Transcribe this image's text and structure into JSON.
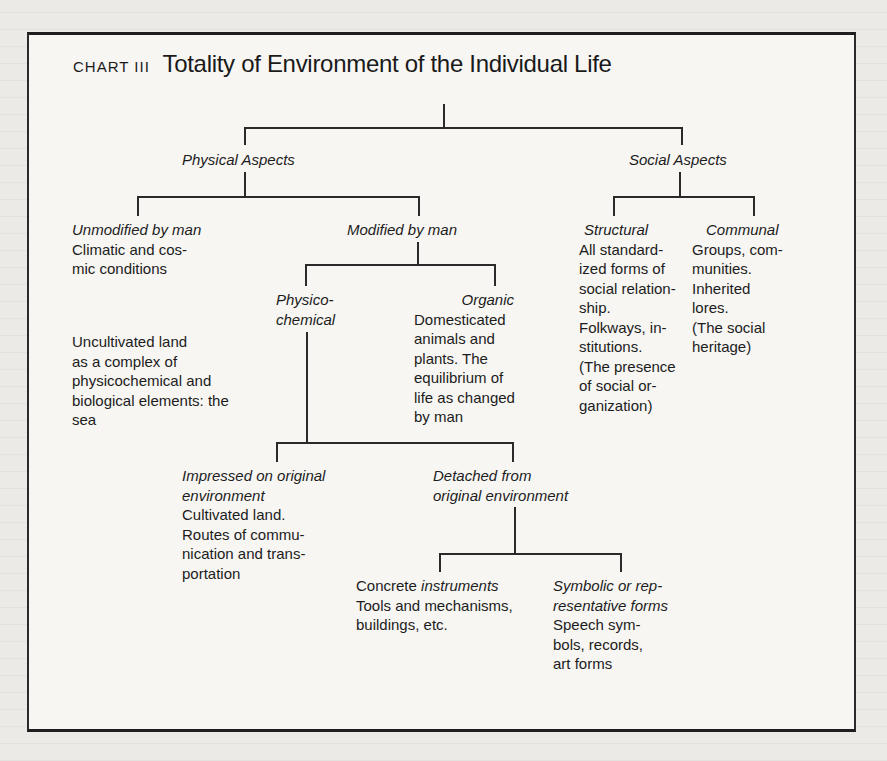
{
  "chart": {
    "label": "CHART III",
    "title": "Totality of Environment of the Individual Life"
  },
  "nodes": {
    "physical": {
      "heading": "Physical Aspects"
    },
    "social": {
      "heading": "Social Aspects"
    },
    "unmodified": {
      "heading": "Unmodified by man",
      "lines": [
        "Climatic and cos-",
        "mic conditions"
      ],
      "lines2": [
        "Uncultivated land",
        "as a complex of",
        "physicochemical and",
        "biological elements: the",
        "sea"
      ]
    },
    "modified": {
      "heading": "Modified by man"
    },
    "physicochemical": {
      "heading_lines": [
        "Physico-",
        "chemical"
      ]
    },
    "organic": {
      "heading": "Organic",
      "lines": [
        "Domesticated",
        "animals and",
        "plants. The",
        "equilibrium of",
        "life as changed",
        "by man"
      ]
    },
    "structural": {
      "heading": "Structural",
      "lines": [
        "All standard-",
        "ized forms of",
        "social relation-",
        "ship.",
        "Folkways, in-",
        "stitutions.",
        "(The presence",
        "of social or-",
        "ganization)"
      ]
    },
    "communal": {
      "heading": "Communal",
      "lines": [
        "Groups, com-",
        "munities.",
        "Inherited",
        "lores.",
        "(The social",
        "heritage)"
      ]
    },
    "impressed": {
      "heading_lines": [
        "Impressed on original",
        "environment"
      ],
      "lines": [
        "Cultivated land.",
        "Routes of commu-",
        "nication and trans-",
        "portation"
      ]
    },
    "detached": {
      "heading_lines": [
        "Detached from",
        "original environment"
      ]
    },
    "concrete": {
      "heading_roman": "Concrete",
      "heading_italic": "instruments",
      "lines": [
        "Tools and mechanisms,",
        "buildings, etc."
      ]
    },
    "symbolic": {
      "heading_lines": [
        "Symbolic or rep-",
        "resentative forms"
      ],
      "lines": [
        "Speech sym-",
        "bols, records,",
        "art forms"
      ]
    }
  }
}
